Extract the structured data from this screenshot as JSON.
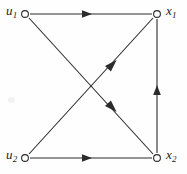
{
  "figure": {
    "kind": "signal-flow-graph",
    "background_color": "#fefefe",
    "stroke_color": "#2b2b2b",
    "node_fill_color": "#ffffff",
    "width": 187,
    "height": 174
  },
  "nodes": [
    {
      "id": "u1",
      "label": "u",
      "subscript": "1",
      "x": 25,
      "y": 14,
      "label_side": "left",
      "shape": "open-circle"
    },
    {
      "id": "x1",
      "label": "x",
      "subscript": "1",
      "x": 157,
      "y": 14,
      "label_side": "right",
      "shape": "open-circle"
    },
    {
      "id": "u2",
      "label": "u",
      "subscript": "2",
      "x": 25,
      "y": 158,
      "label_side": "left",
      "shape": "open-circle"
    },
    {
      "id": "x2",
      "label": "x",
      "subscript": "2",
      "x": 157,
      "y": 158,
      "label_side": "right",
      "shape": "open-circle"
    }
  ],
  "edges": [
    {
      "id": "u1-x1",
      "from": "u1",
      "to": "x1",
      "kind": "horizontal-top",
      "arrow_at": {
        "x": 88,
        "y": 14
      },
      "arrow_direction": "right"
    },
    {
      "id": "u2-x2",
      "from": "u2",
      "to": "x2",
      "kind": "horizontal-bottom",
      "arrow_at": {
        "x": 88,
        "y": 158
      },
      "arrow_direction": "right"
    },
    {
      "id": "x2-x1",
      "from": "x2",
      "to": "x1",
      "kind": "vertical-right",
      "arrow_at": {
        "x": 157,
        "y": 90
      },
      "arrow_direction": "up"
    },
    {
      "id": "u2-x1",
      "from": "u2",
      "to": "x1",
      "kind": "diagonal-rising",
      "arrow_at": {
        "x": 112,
        "y": 65
      },
      "arrow_direction": "up-right"
    },
    {
      "id": "u1-x2",
      "from": "u1",
      "to": "x2",
      "kind": "diagonal-falling",
      "arrow_at": {
        "x": 112,
        "y": 107
      },
      "arrow_direction": "down-right"
    }
  ]
}
